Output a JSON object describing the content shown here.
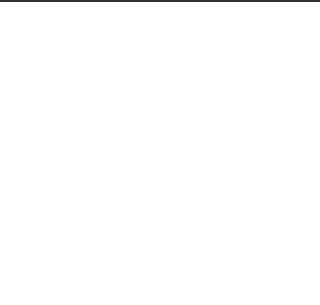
{
  "figure": {
    "stroke_color": "#222222",
    "background": "#ffffff",
    "connector_text": "or"
  },
  "brick_tiling": {
    "rows": [
      {
        "x": 22,
        "y": 33,
        "brick_w": 37.5,
        "brick_h": 18,
        "count": 4
      },
      {
        "x": 41,
        "y": 51,
        "brick_w": 37.5,
        "brick_h": 17,
        "count": 4
      }
    ]
  },
  "grid_tiling": {
    "x": 220,
    "y": 17,
    "width": 75,
    "height": 52,
    "cols": 2,
    "rows": 3
  },
  "hex_tiling": {
    "side": 25,
    "centers": [
      [
        85,
        107
      ],
      [
        49,
        128
      ],
      [
        122,
        130
      ],
      [
        85,
        150
      ],
      [
        48,
        171
      ],
      [
        121,
        173
      ],
      [
        84,
        193
      ]
    ]
  },
  "triangle_tiling": {
    "top_y": 127,
    "mid_y": 171,
    "bottom_y": 214,
    "top_x": [
      179,
      227,
      276
    ],
    "mid_x": [
      153,
      202,
      251,
      302
    ],
    "bottom_x": [
      179,
      228,
      276
    ]
  },
  "polyomino_pieces": [
    {
      "name": "left-piece",
      "points": "127,232 165,232 165,252 145,252 145,290 127,290 127,271 108,271 108,252 127,252"
    },
    {
      "name": "right-piece",
      "points": "178,232 216,232 216,271 235,271 235,290 197,290 197,252 178,252"
    }
  ]
}
